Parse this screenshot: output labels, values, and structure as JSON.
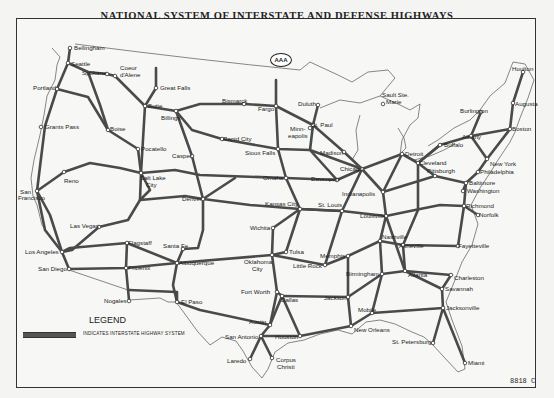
{
  "title": "NATIONAL SYSTEM OF INTERSTATE AND DEFENSE HIGHWAYS",
  "logo": {
    "text": "AAA",
    "icon": "aaa-logo-icon"
  },
  "legend": {
    "title": "LEGEND",
    "swatch_color": "#555555",
    "text": "INDICATES INTERSTATE HIGHWAY SYSTEM"
  },
  "map_code": "8818 C",
  "colors": {
    "highway": "#4a4a4a",
    "border": "#555555",
    "background": "#f7f7f5"
  },
  "cities": [
    {
      "name": "Bellingham",
      "x": 70,
      "y": 48,
      "lx": 74,
      "ly": 50
    },
    {
      "name": "Seattle",
      "x": 68,
      "y": 63,
      "lx": 71,
      "ly": 66
    },
    {
      "name": "Spokane",
      "x": 107,
      "y": 74,
      "lx": 82,
      "ly": 75
    },
    {
      "name": "Coeur",
      "x": 115,
      "y": 76,
      "lx": 120,
      "ly": 70
    },
    {
      "name": "d'Alene",
      "x": 115,
      "y": 76,
      "lx": 120,
      "ly": 77
    },
    {
      "name": "Portland",
      "x": 57,
      "y": 89,
      "lx": 33,
      "ly": 90
    },
    {
      "name": "Great Falls",
      "x": 156,
      "y": 88,
      "lx": 160,
      "ly": 90
    },
    {
      "name": "Butte",
      "x": 145,
      "y": 106,
      "lx": 148,
      "ly": 108
    },
    {
      "name": "Billings",
      "x": 176,
      "y": 111,
      "lx": 161,
      "ly": 120
    },
    {
      "name": "Bismarck",
      "x": 244,
      "y": 104,
      "lx": 222,
      "ly": 103
    },
    {
      "name": "Fargo",
      "x": 276,
      "y": 106,
      "lx": 258,
      "ly": 111
    },
    {
      "name": "Duluth",
      "x": 318,
      "y": 105,
      "lx": 298,
      "ly": 106
    },
    {
      "name": "Sault Ste.",
      "x": 383,
      "y": 104,
      "lx": 382,
      "ly": 97
    },
    {
      "name": "Marie",
      "x": 383,
      "y": 104,
      "lx": 386,
      "ly": 104
    },
    {
      "name": "Houlton",
      "x": 523,
      "y": 72,
      "lx": 512,
      "ly": 71
    },
    {
      "name": "Augusta",
      "x": 513,
      "y": 103,
      "lx": 515,
      "ly": 106
    },
    {
      "name": "Burlington",
      "x": 481,
      "y": 112,
      "lx": 460,
      "ly": 113
    },
    {
      "name": "Boston",
      "x": 510,
      "y": 129,
      "lx": 512,
      "ly": 131
    },
    {
      "name": "Albany",
      "x": 471,
      "y": 136,
      "lx": 462,
      "ly": 139
    },
    {
      "name": "Buffalo",
      "x": 440,
      "y": 145,
      "lx": 444,
      "ly": 147
    },
    {
      "name": "Grants Pass",
      "x": 41,
      "y": 127,
      "lx": 45,
      "ly": 129
    },
    {
      "name": "Boise",
      "x": 108,
      "y": 130,
      "lx": 110,
      "ly": 131
    },
    {
      "name": "Rapid City",
      "x": 222,
      "y": 139,
      "lx": 223,
      "ly": 141
    },
    {
      "name": "St. Paul",
      "x": 313,
      "y": 125,
      "lx": 311,
      "ly": 127
    },
    {
      "name": "Minn-",
      "x": 310,
      "y": 128,
      "lx": 290,
      "ly": 131
    },
    {
      "name": "eapolis",
      "x": 310,
      "y": 128,
      "lx": 288,
      "ly": 138
    },
    {
      "name": "Pocatello",
      "x": 138,
      "y": 149,
      "lx": 141,
      "ly": 151
    },
    {
      "name": "Sioux Falls",
      "x": 278,
      "y": 149,
      "lx": 245,
      "ly": 155
    },
    {
      "name": "Madison",
      "x": 344,
      "y": 152,
      "lx": 320,
      "ly": 155
    },
    {
      "name": "Detroit",
      "x": 402,
      "y": 154,
      "lx": 405,
      "ly": 156
    },
    {
      "name": "Cleveland",
      "x": 418,
      "y": 163,
      "lx": 419,
      "ly": 165
    },
    {
      "name": "New York",
      "x": 487,
      "y": 159,
      "lx": 490,
      "ly": 166
    },
    {
      "name": "Philadelphia",
      "x": 478,
      "y": 172,
      "lx": 480,
      "ly": 174
    },
    {
      "name": "Casper",
      "x": 192,
      "y": 156,
      "lx": 172,
      "ly": 158
    },
    {
      "name": "Salt Lake",
      "x": 141,
      "y": 173,
      "lx": 140,
      "ly": 180
    },
    {
      "name": "City",
      "x": 141,
      "y": 173,
      "lx": 146,
      "ly": 187
    },
    {
      "name": "Reno",
      "x": 64,
      "y": 172,
      "lx": 64,
      "ly": 183
    },
    {
      "name": "Omaha",
      "x": 286,
      "y": 178,
      "lx": 263,
      "ly": 180
    },
    {
      "name": "Davenport",
      "x": 337,
      "y": 180,
      "lx": 311,
      "ly": 181
    },
    {
      "name": "Chicago",
      "x": 362,
      "y": 169,
      "lx": 340,
      "ly": 171
    },
    {
      "name": "Pittsburgh",
      "x": 435,
      "y": 176,
      "lx": 427,
      "ly": 173
    },
    {
      "name": "Baltimore",
      "x": 466,
      "y": 183,
      "lx": 469,
      "ly": 185
    },
    {
      "name": "Washington",
      "x": 463,
      "y": 191,
      "lx": 467,
      "ly": 193
    },
    {
      "name": "San",
      "x": 37,
      "y": 191,
      "lx": 20,
      "ly": 194
    },
    {
      "name": "Francisco",
      "x": 37,
      "y": 191,
      "lx": 18,
      "ly": 200
    },
    {
      "name": "Denver",
      "x": 203,
      "y": 199,
      "lx": 182,
      "ly": 201
    },
    {
      "name": "Indianapolis",
      "x": 383,
      "y": 192,
      "lx": 342,
      "ly": 196
    },
    {
      "name": "Kansas City",
      "x": 300,
      "y": 209,
      "lx": 265,
      "ly": 206
    },
    {
      "name": "St. Louis",
      "x": 342,
      "y": 211,
      "lx": 318,
      "ly": 207
    },
    {
      "name": "Richmond",
      "x": 464,
      "y": 206,
      "lx": 466,
      "ly": 208
    },
    {
      "name": "Norfolk",
      "x": 478,
      "y": 215,
      "lx": 479,
      "ly": 217
    },
    {
      "name": "Louisville",
      "x": 386,
      "y": 216,
      "lx": 360,
      "ly": 218
    },
    {
      "name": "Wichita",
      "x": 273,
      "y": 228,
      "lx": 250,
      "ly": 230
    },
    {
      "name": "Las Vegas",
      "x": 99,
      "y": 227,
      "lx": 70,
      "ly": 228
    },
    {
      "name": "Nashville",
      "x": 380,
      "y": 241,
      "lx": 382,
      "ly": 239
    },
    {
      "name": "Asheville",
      "x": 403,
      "y": 245,
      "lx": 399,
      "ly": 248
    },
    {
      "name": "Fayetteville",
      "x": 458,
      "y": 246,
      "lx": 458,
      "ly": 248
    },
    {
      "name": "Flagstaff",
      "x": 127,
      "y": 243,
      "lx": 128,
      "ly": 245
    },
    {
      "name": "Santa Fe",
      "x": 183,
      "y": 249,
      "lx": 163,
      "ly": 248
    },
    {
      "name": "Tulsa",
      "x": 286,
      "y": 252,
      "lx": 289,
      "ly": 254
    },
    {
      "name": "Memphis",
      "x": 348,
      "y": 256,
      "lx": 320,
      "ly": 258
    },
    {
      "name": "Los Angeles",
      "x": 62,
      "y": 252,
      "lx": 25,
      "ly": 254
    },
    {
      "name": "Oklahoma",
      "x": 272,
      "y": 255,
      "lx": 244,
      "ly": 264
    },
    {
      "name": "City",
      "x": 272,
      "y": 255,
      "lx": 252,
      "ly": 271
    },
    {
      "name": "Little Rock",
      "x": 325,
      "y": 265,
      "lx": 293,
      "ly": 268
    },
    {
      "name": "Charleston",
      "x": 451,
      "y": 275,
      "lx": 454,
      "ly": 280
    },
    {
      "name": "San Diego",
      "x": 69,
      "y": 269,
      "lx": 38,
      "ly": 271
    },
    {
      "name": "Phoenix",
      "x": 126,
      "y": 268,
      "lx": 128,
      "ly": 270
    },
    {
      "name": "Albuquerque",
      "x": 177,
      "y": 263,
      "lx": 179,
      "ly": 265
    },
    {
      "name": "Birmingham",
      "x": 382,
      "y": 274,
      "lx": 346,
      "ly": 276
    },
    {
      "name": "Atlanta",
      "x": 405,
      "y": 271,
      "lx": 408,
      "ly": 277
    },
    {
      "name": "Savannah",
      "x": 442,
      "y": 289,
      "lx": 445,
      "ly": 291
    },
    {
      "name": "Fort Worth",
      "x": 277,
      "y": 292,
      "lx": 241,
      "ly": 294
    },
    {
      "name": "Dallas",
      "x": 282,
      "y": 296,
      "lx": 281,
      "ly": 302
    },
    {
      "name": "Jackson",
      "x": 348,
      "y": 297,
      "lx": 324,
      "ly": 300
    },
    {
      "name": "Nogales",
      "x": 129,
      "y": 301,
      "lx": 104,
      "ly": 303
    },
    {
      "name": "El Paso",
      "x": 177,
      "y": 302,
      "lx": 181,
      "ly": 304
    },
    {
      "name": "Jacksonville",
      "x": 443,
      "y": 308,
      "lx": 446,
      "ly": 310
    },
    {
      "name": "Mobile",
      "x": 372,
      "y": 313,
      "lx": 358,
      "ly": 312
    },
    {
      "name": "Austin",
      "x": 270,
      "y": 325,
      "lx": 249,
      "ly": 324
    },
    {
      "name": "New Orleans",
      "x": 351,
      "y": 326,
      "lx": 354,
      "ly": 332
    },
    {
      "name": "San Antonio",
      "x": 261,
      "y": 336,
      "lx": 225,
      "ly": 339
    },
    {
      "name": "Houston",
      "x": 300,
      "y": 336,
      "lx": 275,
      "ly": 339
    },
    {
      "name": "St. Petersburg",
      "x": 433,
      "y": 343,
      "lx": 392,
      "ly": 344
    },
    {
      "name": "Laredo",
      "x": 250,
      "y": 359,
      "lx": 227,
      "ly": 363
    },
    {
      "name": "Corpus",
      "x": 272,
      "y": 358,
      "lx": 276,
      "ly": 362
    },
    {
      "name": "Christi",
      "x": 272,
      "y": 358,
      "lx": 277,
      "ly": 369
    },
    {
      "name": "Miami",
      "x": 465,
      "y": 363,
      "lx": 468,
      "ly": 365
    }
  ]
}
